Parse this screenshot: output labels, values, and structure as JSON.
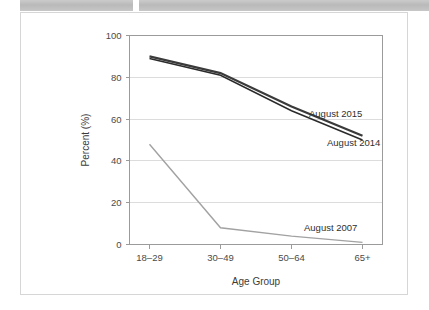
{
  "header": {
    "strips": [
      {
        "name": "redacted-strip-left"
      },
      {
        "name": "redacted-strip-right"
      }
    ]
  },
  "chart_data": {
    "type": "line",
    "title": "",
    "xlabel": "Age Group",
    "ylabel": "Percent (%)",
    "categories": [
      "18–29",
      "30–49",
      "50–64",
      "65+"
    ],
    "ylim": [
      0,
      100
    ],
    "yticks": [
      0,
      20,
      40,
      60,
      80,
      100
    ],
    "ytick_labels": [
      "0",
      "20",
      "40",
      "60",
      "80",
      "100"
    ],
    "grid": true,
    "legend_position": "inline-labels",
    "series": [
      {
        "name": "August 2015",
        "values": [
          90,
          82,
          66,
          52
        ],
        "color": "#3a3a3a",
        "label_x": 288,
        "label_y": 104
      },
      {
        "name": "August 2014",
        "values": [
          89,
          81,
          64,
          50
        ],
        "color": "#2b2b2b",
        "label_x": 306,
        "label_y": 133
      },
      {
        "name": "August 2007",
        "values": [
          48,
          8,
          4,
          1
        ],
        "color": "#a2a2a2",
        "label_x": 283,
        "label_y": 218
      }
    ]
  }
}
